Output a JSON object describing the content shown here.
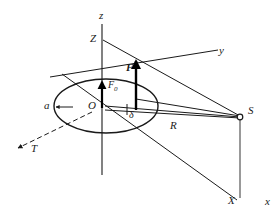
{
  "figure": {
    "type": "3d-coordinate-vector-diagram",
    "background_color": "#ffffff",
    "stroke_color": "#1a1a1a",
    "labels": {
      "axis_z_lower": "z",
      "axis_z_upper": "Z",
      "axis_y": "y",
      "axis_x_lower": "x",
      "axis_x_upper": "X",
      "axis_t": "T",
      "origin": "O",
      "radius_a": "a",
      "force_f": "F",
      "force_f0_base": "F",
      "force_f0_sub": "0",
      "distance_r": "R",
      "angle_delta": "δ",
      "point_s": "S"
    },
    "elements": [
      {
        "name": "z-axis",
        "kind": "line",
        "label": "z"
      },
      {
        "name": "Z-label-point",
        "kind": "label",
        "label": "Z"
      },
      {
        "name": "y-axis",
        "kind": "line",
        "label": "y"
      },
      {
        "name": "x-axis",
        "kind": "line",
        "label": "x"
      },
      {
        "name": "X-label-point",
        "kind": "label",
        "label": "X"
      },
      {
        "name": "T-axis",
        "kind": "dashed-arrow",
        "label": "T"
      },
      {
        "name": "equatorial-ellipse",
        "kind": "ellipse"
      },
      {
        "name": "force-vector-F",
        "kind": "arrow",
        "label": "F"
      },
      {
        "name": "force-vector-F0",
        "kind": "arrow",
        "label": "F0"
      },
      {
        "name": "radius-segment-R",
        "kind": "line",
        "label": "R"
      },
      {
        "name": "satellite-point-S",
        "kind": "open-circle",
        "label": "S"
      },
      {
        "name": "angle-marker-delta",
        "kind": "angle",
        "label": "δ"
      }
    ]
  }
}
